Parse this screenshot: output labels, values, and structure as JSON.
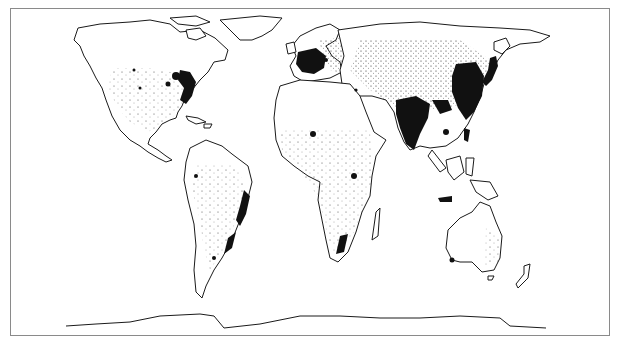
{
  "figure": {
    "type": "world population distribution map",
    "projection": "equal-area (Gall-Peters style)",
    "legend": "dots = population; solid black = high population density",
    "colors": {
      "outline": "#1a1a1a",
      "dense": "#111111",
      "background": "#ffffff",
      "frame": "#8a8a8a"
    },
    "caption": ""
  },
  "regions": [
    {
      "name": "North America",
      "density": "dense east coast, sparse west"
    },
    {
      "name": "South America",
      "density": "coastal concentration, SE Brazil dense"
    },
    {
      "name": "Europe",
      "density": "very dense west-central"
    },
    {
      "name": "Africa",
      "density": "scattered; Nile, West Africa, East Africa clusters"
    },
    {
      "name": "South Asia",
      "density": "very dense (India, Bangladesh)"
    },
    {
      "name": "East Asia",
      "density": "very dense (eastern China, Japan)"
    },
    {
      "name": "Southeast Asia",
      "density": "dense Java, Philippines"
    },
    {
      "name": "Australia",
      "density": "sparse, SE coast dotted"
    },
    {
      "name": "Antarctica",
      "density": "none"
    }
  ]
}
